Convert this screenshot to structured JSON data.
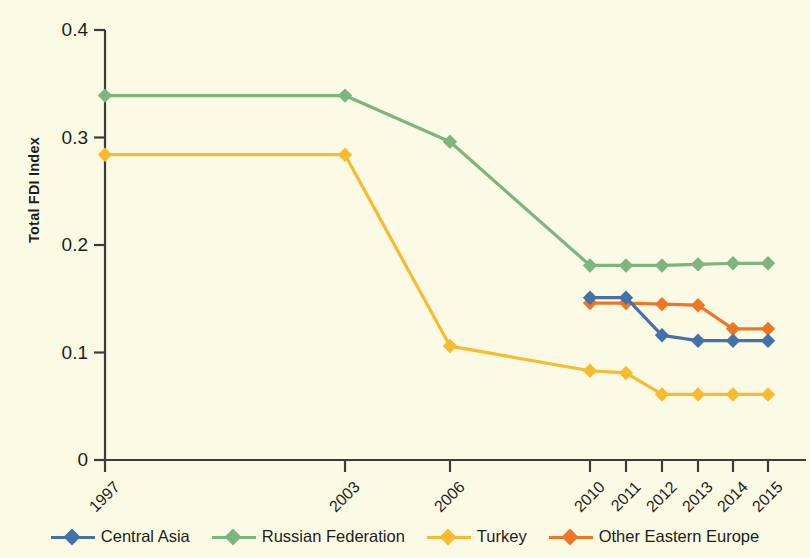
{
  "chart_data": {
    "type": "line",
    "title": "",
    "subtitle": "",
    "xlabel": "",
    "ylabel": "Total FDI Index",
    "categories": [
      "1997",
      "2003",
      "2006",
      "2010",
      "2011",
      "2012",
      "2013",
      "2014",
      "2015"
    ],
    "ylim": [
      0,
      0.4
    ],
    "yticks": [
      "0",
      "0.1",
      "0.2",
      "0.3",
      "0.4"
    ],
    "ytick_values": [
      0,
      0.1,
      0.2,
      0.3,
      0.4
    ],
    "grid": false,
    "legend_position": "bottom",
    "marker": "diamond",
    "series": [
      {
        "name": "Central Asia",
        "color": "#4472a8",
        "values": [
          null,
          null,
          null,
          0.151,
          0.151,
          0.116,
          0.111,
          0.111,
          0.111
        ]
      },
      {
        "name": "Russian Federation",
        "color": "#7cb57f",
        "values": [
          0.339,
          0.339,
          0.296,
          0.181,
          0.181,
          0.181,
          0.182,
          0.183,
          0.183
        ]
      },
      {
        "name": "Turkey",
        "color": "#f7bb30",
        "values": [
          0.284,
          0.284,
          0.106,
          0.083,
          0.081,
          0.061,
          0.061,
          0.061,
          0.061
        ]
      },
      {
        "name": "Other Eastern Europe",
        "color": "#ee7625",
        "values": [
          null,
          null,
          null,
          0.146,
          0.146,
          0.145,
          0.144,
          0.122,
          0.122
        ]
      }
    ]
  },
  "legend": {
    "items": [
      {
        "label": "Central Asia"
      },
      {
        "label": "Russian Federation"
      },
      {
        "label": "Turkey"
      },
      {
        "label": "Other Eastern Europe"
      }
    ]
  },
  "colors": {
    "background": "#fbfae4",
    "axis": "#3c3c3b",
    "text": "#1d1d1b",
    "central_asia": "#4472a8",
    "russian_federation": "#7cb57f",
    "turkey": "#f7bb30",
    "other_eastern_europe": "#ee7625"
  }
}
